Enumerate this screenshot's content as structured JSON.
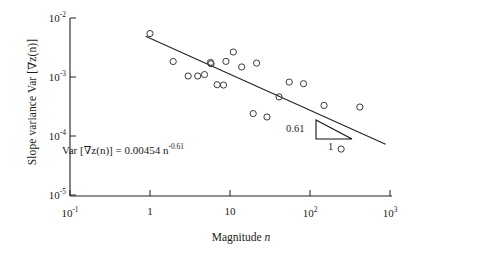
{
  "chart_data": {
    "type": "scatter",
    "title": "",
    "xlabel": "Magnitude n",
    "ylabel": "Slope variance Var [∇z(n)]",
    "xscale": "log",
    "yscale": "log",
    "xlim": [
      0.1,
      1000
    ],
    "ylim": [
      1e-05,
      0.01
    ],
    "grid": false,
    "legend": null,
    "xticks": [
      {
        "value": 0.1,
        "label_base": "10",
        "label_exp": "-1"
      },
      {
        "value": 1,
        "label_base": "1",
        "label_exp": ""
      },
      {
        "value": 10,
        "label_base": "10",
        "label_exp": ""
      },
      {
        "value": 100,
        "label_base": "10",
        "label_exp": "2"
      },
      {
        "value": 1000,
        "label_base": "10",
        "label_exp": "3"
      }
    ],
    "yticks": [
      {
        "value": 0.01,
        "label_base": "10",
        "label_exp": "-2"
      },
      {
        "value": 0.001,
        "label_base": "10",
        "label_exp": "-3"
      },
      {
        "value": 0.0001,
        "label_base": "10",
        "label_exp": "-4"
      },
      {
        "value": 1e-05,
        "label_base": "10",
        "label_exp": "-5"
      }
    ],
    "marker": "open-circle",
    "points": [
      {
        "x": 1.0,
        "y": 0.00545
      },
      {
        "x": 1.95,
        "y": 0.00183
      },
      {
        "x": 3.0,
        "y": 0.00104
      },
      {
        "x": 3.95,
        "y": 0.00104
      },
      {
        "x": 4.8,
        "y": 0.0011
      },
      {
        "x": 5.7,
        "y": 0.00176
      },
      {
        "x": 5.8,
        "y": 0.00168
      },
      {
        "x": 6.9,
        "y": 0.00074
      },
      {
        "x": 8.3,
        "y": 0.00073
      },
      {
        "x": 8.9,
        "y": 0.00184
      },
      {
        "x": 11.0,
        "y": 0.00265
      },
      {
        "x": 14.0,
        "y": 0.00148
      },
      {
        "x": 19.5,
        "y": 0.00024
      },
      {
        "x": 21.5,
        "y": 0.00172
      },
      {
        "x": 29.0,
        "y": 0.00021
      },
      {
        "x": 41.0,
        "y": 0.00046
      },
      {
        "x": 55.0,
        "y": 0.00082
      },
      {
        "x": 83.0,
        "y": 0.00077
      },
      {
        "x": 150.0,
        "y": 0.00033
      },
      {
        "x": 245.0,
        "y": 6e-05
      },
      {
        "x": 420.0,
        "y": 0.00031
      }
    ],
    "fit_line": {
      "equation_text": "Var [∇z(n)] = 0.00454 n",
      "equation_exponent": "-0.61",
      "coefficient": 0.00454,
      "exponent": -0.61,
      "x_start": 0.88,
      "x_end": 880.0
    },
    "slope_triangle": {
      "rise_label": "0.61",
      "run_label": "1",
      "x_left_px": 316,
      "x_right_px": 352,
      "y_top_px": 120,
      "y_bottom_px": 139
    }
  },
  "axis_style": {
    "line_color": "#222222",
    "marker_edge_color": "#3a3a3a",
    "fit_line_color": "#222222"
  }
}
